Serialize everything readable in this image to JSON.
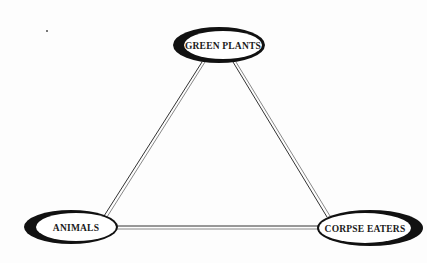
{
  "diagram": {
    "type": "cycle-triangle",
    "nodes": [
      {
        "id": "green_plants",
        "label": "GREEN PLANTS"
      },
      {
        "id": "animals",
        "label": "ANIMALS"
      },
      {
        "id": "corpse_eaters",
        "label": "CORPSE EATERS"
      }
    ],
    "edges": [
      {
        "from": "green_plants",
        "to": "animals"
      },
      {
        "from": "green_plants",
        "to": "corpse_eaters"
      },
      {
        "from": "animals",
        "to": "corpse_eaters"
      }
    ],
    "colors": {
      "background": "#fdfdfd",
      "node_ring": "#111111",
      "node_fill": "#ffffff",
      "edge": "#333333"
    }
  }
}
